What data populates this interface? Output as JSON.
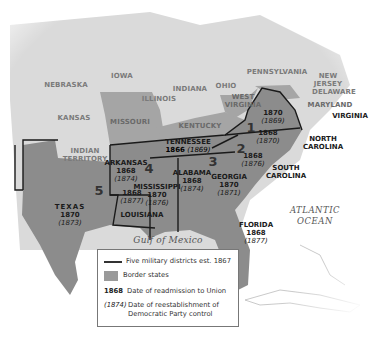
{
  "map": {
    "colors": {
      "background": "#ffffff",
      "union_states": "#d9d9d9",
      "border_states": "#9a9a9a",
      "confederate_states": "#8c8c8c",
      "district_lines": "#1a1a1a",
      "water": "#ffffff"
    },
    "union_labels": [
      "NEBRASKA",
      "IOWA",
      "ILLINOIS",
      "INDIANA",
      "OHIO",
      "PENNSYLVANIA",
      "NEW JERSEY",
      "DELAWARE",
      "KANSAS",
      "INDIAN TERRITORY"
    ],
    "border_labels": [
      "MISSOURI",
      "KENTUCKY",
      "WEST VIRGINIA",
      "MARYLAND"
    ],
    "states": [
      {
        "name": "VIRGINIA",
        "readmitted": "1870",
        "democratic_control": "(1869)"
      },
      {
        "name": "NORTH CAROLINA",
        "readmitted": "1868",
        "democratic_control": "(1870)"
      },
      {
        "name": "SOUTH CAROLINA",
        "readmitted": "1868",
        "democratic_control": "(1876)"
      },
      {
        "name": "TENNESSEE",
        "readmitted": "1866",
        "democratic_control": "(1869)"
      },
      {
        "name": "ALABAMA",
        "readmitted": "1868",
        "democratic_control": "(1874)"
      },
      {
        "name": "GEORGIA",
        "readmitted": "1870",
        "democratic_control": "(1871)"
      },
      {
        "name": "ARKANSAS",
        "readmitted": "1868",
        "democratic_control": "(1874)"
      },
      {
        "name": "MISSISSIPPI",
        "readmitted": "1870",
        "democratic_control": "(1876)"
      },
      {
        "name": "LOUISIANA",
        "readmitted": "1868",
        "democratic_control": "(1877)"
      },
      {
        "name": "TEXAS",
        "readmitted": "1870",
        "democratic_control": "(1873)"
      },
      {
        "name": "FLORIDA",
        "readmitted": "1868",
        "democratic_control": "(1877)"
      }
    ],
    "districts": [
      "1",
      "2",
      "3",
      "4",
      "5"
    ],
    "water_labels": {
      "gulf": "Gulf of Mexico",
      "atlantic_line1": "ATLANTIC",
      "atlantic_line2": "OCEAN"
    }
  },
  "legend": {
    "items": [
      {
        "key": "",
        "label": "Five military districts est. 1867"
      },
      {
        "key": "",
        "label": "Border states"
      },
      {
        "key": "1868",
        "label": "Date of readmission to Union"
      },
      {
        "key": "(1874)",
        "label": "Date of reestablishment of Democratic Party control"
      }
    ]
  }
}
